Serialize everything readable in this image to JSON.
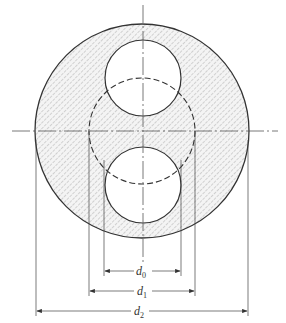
{
  "diagram": {
    "type": "engineering cross-section",
    "colors": {
      "line": "#333333",
      "hatch": "#9a9a9a",
      "fill": "#f4f4f4",
      "background": "#ffffff"
    },
    "outer_circle": {
      "cx": 142,
      "cy": 131,
      "r": 107,
      "hatched": true
    },
    "dashed_circle": {
      "cx": 142,
      "cy": 131,
      "r": 53
    },
    "top_hole": {
      "cx": 143,
      "cy": 78,
      "r": 38
    },
    "bottom_hole": {
      "cx": 143,
      "cy": 185,
      "r": 38
    },
    "dimensions": [
      {
        "label": "d",
        "subscript": "0",
        "y": 271,
        "x1": 104,
        "x2": 181
      },
      {
        "label": "d",
        "subscript": "1",
        "y": 291,
        "x1": 89,
        "x2": 195
      },
      {
        "label": "d",
        "subscript": "2",
        "y": 311,
        "x1": 36,
        "x2": 248
      }
    ]
  }
}
